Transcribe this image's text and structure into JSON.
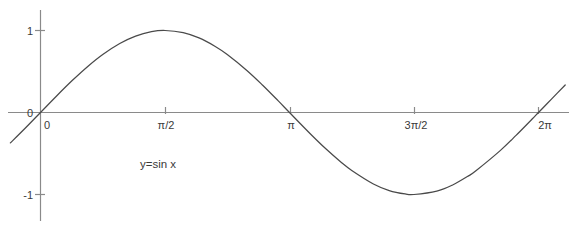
{
  "chart_data": {
    "type": "line",
    "title": "",
    "subtitle": "",
    "xlabel": "",
    "ylabel": "",
    "annotation": "y=sin x",
    "function": "y = sin x",
    "grid": false,
    "legend": false,
    "legend_position": "none",
    "axis_color": "#8a8a8a",
    "curve_color": "#4a4a4a",
    "text_color": "#3a3a3a",
    "background": "#ffffff",
    "xlim": [
      -0.38,
      6.62
    ],
    "ylim": [
      -1.25,
      1.25
    ],
    "x_ticks": [
      {
        "value": 0,
        "label": "0"
      },
      {
        "value": 1.5707963,
        "label": "π/2"
      },
      {
        "value": 3.1415927,
        "label": "π"
      },
      {
        "value": 4.712389,
        "label": "3π/2"
      },
      {
        "value": 6.2831853,
        "label": "2π"
      }
    ],
    "y_ticks": [
      {
        "value": 1,
        "label": "1"
      },
      {
        "value": 0,
        "label": "0"
      },
      {
        "value": -1,
        "label": "-1"
      }
    ],
    "series": [
      {
        "name": "y=sin x",
        "x": [
          -0.38,
          -0.2,
          0,
          0.2,
          0.4,
          0.6,
          0.7854,
          1.0,
          1.2,
          1.4,
          1.5708,
          1.8,
          2.0,
          2.2,
          2.3562,
          2.6,
          2.8,
          3.0,
          3.1416,
          3.4,
          3.6,
          3.8,
          3.927,
          4.2,
          4.4,
          4.6,
          4.7124,
          5.0,
          5.2,
          5.4,
          5.4978,
          5.8,
          6.0,
          6.2,
          6.2832,
          6.45,
          6.62
        ],
        "y": [
          -0.3709,
          -0.1987,
          0,
          0.1987,
          0.3894,
          0.5646,
          0.7071,
          0.8415,
          0.932,
          0.9854,
          1.0,
          0.9738,
          0.9093,
          0.8085,
          0.7071,
          0.5155,
          0.335,
          0.1411,
          0,
          -0.2555,
          -0.4425,
          -0.6119,
          -0.7071,
          -0.8716,
          -0.9516,
          -0.9937,
          -1.0,
          -0.9589,
          -0.8835,
          -0.7728,
          -0.7071,
          -0.4646,
          -0.2794,
          -0.0831,
          0,
          0.1663,
          0.335
        ]
      }
    ]
  },
  "labels": {
    "y_one": "1",
    "y_zero": "0",
    "y_minus_one": "-1",
    "x_zero": "0",
    "x_half_pi": "π/2",
    "x_pi": "π",
    "x_three_half_pi": "3π/2",
    "x_two_pi": "2π",
    "equation": "y=sin x"
  }
}
